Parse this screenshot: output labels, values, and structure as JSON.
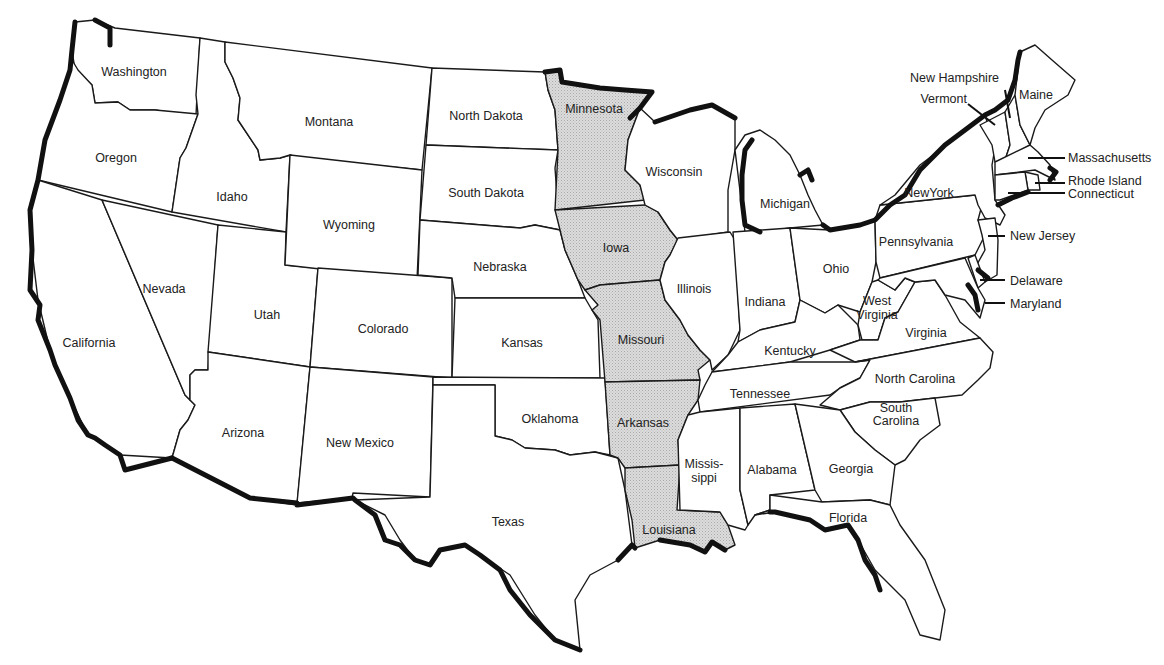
{
  "map": {
    "title": "",
    "highlight_color": "#d4d4d4",
    "outline_color": "#111111",
    "highlighted_states": [
      "Minnesota",
      "Iowa",
      "Missouri",
      "Arkansas",
      "Louisiana"
    ],
    "labels": {
      "washington": "Washington",
      "oregon": "Oregon",
      "california": "California",
      "idaho": "Idaho",
      "nevada": "Nevada",
      "montana": "Montana",
      "wyoming": "Wyoming",
      "utah": "Utah",
      "arizona": "Arizona",
      "colorado": "Colorado",
      "new_mexico": "New Mexico",
      "north_dakota": "North Dakota",
      "south_dakota": "South Dakota",
      "nebraska": "Nebraska",
      "kansas": "Kansas",
      "oklahoma": "Oklahoma",
      "texas": "Texas",
      "minnesota": "Minnesota",
      "iowa": "Iowa",
      "missouri": "Missouri",
      "arkansas": "Arkansas",
      "louisiana": "Louisiana",
      "wisconsin": "Wisconsin",
      "illinois": "Illinois",
      "michigan": "Michigan",
      "indiana": "Indiana",
      "ohio": "Ohio",
      "kentucky": "Kentucky",
      "tennessee": "Tennessee",
      "mississippi_1": "Missis-",
      "mississippi_2": "sippi",
      "alabama": "Alabama",
      "georgia": "Georgia",
      "florida": "Florida",
      "south_carolina_1": "South",
      "south_carolina_2": "Carolina",
      "north_carolina": "North Carolina",
      "virginia": "Virginia",
      "west_virginia_1": "West",
      "west_virginia_2": "Virginia",
      "pennsylvania": "Pennsylvania",
      "new_york": "NewYork",
      "vermont": "Vermont",
      "new_hampshire": "New Hampshire",
      "maine": "Maine",
      "massachusetts": "Massachusetts",
      "rhode_island": "Rhode Island",
      "connecticut": "Connecticut",
      "new_jersey": "New Jersey",
      "delaware": "Delaware",
      "maryland": "Maryland"
    }
  }
}
